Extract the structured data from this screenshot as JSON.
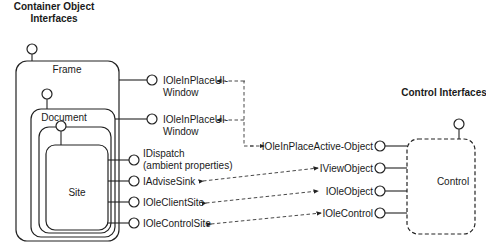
{
  "headers": {
    "container": [
      "Container Object",
      "Interfaces"
    ],
    "control": "Control Interfaces"
  },
  "boxes": {
    "frame": "Frame",
    "document": "Document",
    "site": "Site",
    "control": "Control"
  },
  "container_interfaces": {
    "frame_ui_window": [
      "IOleInPlaceUI-",
      "Window"
    ],
    "document_ui_window": [
      "IOleInPlaceUI-",
      "Window"
    ],
    "dispatch": [
      "IDispatch",
      "(ambient properties)"
    ],
    "advise_sink": "IAdviseSink",
    "client_site": "IOleClientSite",
    "control_site": "IOleControlSite"
  },
  "control_interfaces": {
    "inplace_active_object": "IOleInPlaceActive-Object",
    "view_object": "IViewObject",
    "ole_object": "IOleObject",
    "ole_control": "IOleControl"
  }
}
